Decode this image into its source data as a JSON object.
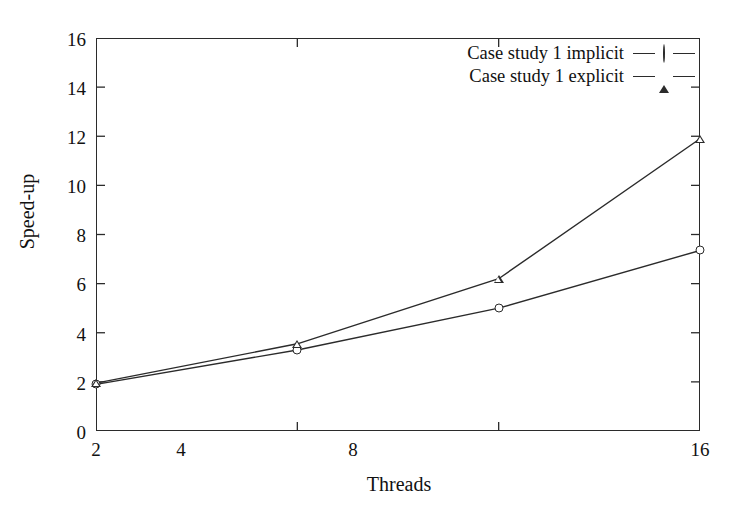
{
  "chart_data": {
    "type": "line",
    "title": "",
    "xlabel": "Threads",
    "ylabel": "Speed-up",
    "x": [
      2,
      4,
      8,
      16
    ],
    "xtick_labels": [
      "2",
      "4",
      "8",
      "16"
    ],
    "ytick_labels": [
      "0",
      "2",
      "4",
      "6",
      "8",
      "10",
      "12",
      "14",
      "16"
    ],
    "yticks": [
      0,
      2,
      4,
      6,
      8,
      10,
      12,
      14,
      16
    ],
    "ylim": [
      0,
      16
    ],
    "xscale": "log2",
    "grid": false,
    "legend_position": "top-right",
    "series": [
      {
        "name": "Case study 1 implicit",
        "marker": "circle-open",
        "values": [
          1.9,
          3.3,
          5.0,
          7.35
        ]
      },
      {
        "name": "Case study 1 explicit",
        "marker": "triangle-open",
        "values": [
          1.95,
          3.55,
          6.2,
          11.9
        ]
      }
    ],
    "colors": {
      "line": "#2b2b2b",
      "axis": "#2b2b2b",
      "text": "#111111",
      "background": "#ffffff"
    }
  },
  "legend": {
    "entries": [
      {
        "label": "Case study 1 implicit",
        "marker": "circle-open"
      },
      {
        "label": "Case study 1 explicit",
        "marker": "triangle-open"
      }
    ]
  },
  "axes": {
    "x_title": "Threads",
    "y_title": "Speed-up"
  }
}
